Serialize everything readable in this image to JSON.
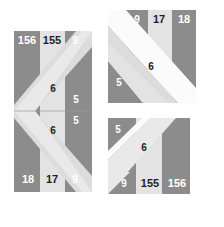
{
  "canvas": {
    "width": 224,
    "height": 227,
    "background": "#ffffff"
  },
  "palette": {
    "dark_gray": "#8c8c8c",
    "mid_gray": "#a8a8a8",
    "light_gray": "#e3e3e3",
    "pale_gray": "#d8d8d8",
    "white": "#ffffff",
    "label_light": "#ffffff",
    "label_dark": "#231f20",
    "hairline": "#9a9a9a"
  },
  "figures": [
    {
      "id": "shape-left",
      "name": "left-chevron-figure",
      "bounds": {
        "x": 14,
        "y": 31,
        "width": 78,
        "height": 161
      },
      "labels": [
        {
          "id": "l-156",
          "text": "156",
          "x": 27,
          "y": 41,
          "tone": "light",
          "size": "s11"
        },
        {
          "id": "l-155",
          "text": "155",
          "x": 52,
          "y": 41,
          "tone": "dark",
          "size": "s11"
        },
        {
          "id": "l-9t",
          "text": "9",
          "x": 75,
          "y": 41,
          "tone": "light",
          "size": "s10"
        },
        {
          "id": "l-6t",
          "text": "6",
          "x": 53,
          "y": 89,
          "tone": "dark",
          "size": "s10"
        },
        {
          "id": "l-5t",
          "text": "5",
          "x": 76,
          "y": 100,
          "tone": "light",
          "size": "s10"
        },
        {
          "id": "l-5b",
          "text": "5",
          "x": 76,
          "y": 121,
          "tone": "light",
          "size": "s10"
        },
        {
          "id": "l-6b",
          "text": "6",
          "x": 53,
          "y": 131,
          "tone": "dark",
          "size": "s10"
        },
        {
          "id": "l-18",
          "text": "18",
          "x": 28,
          "y": 180,
          "tone": "light",
          "size": "s11"
        },
        {
          "id": "l-17",
          "text": "17",
          "x": 52,
          "y": 180,
          "tone": "dark",
          "size": "s11"
        },
        {
          "id": "l-9b",
          "text": "9",
          "x": 75,
          "y": 180,
          "tone": "light",
          "size": "s10"
        }
      ]
    },
    {
      "id": "shape-topright",
      "name": "top-right-triangle-figure",
      "bounds": {
        "x": 108,
        "y": 10,
        "width": 88,
        "height": 93
      },
      "labels": [
        {
          "id": "tr-9",
          "text": "9",
          "x": 137,
          "y": 20,
          "tone": "light",
          "size": "s10"
        },
        {
          "id": "tr-17",
          "text": "17",
          "x": 159,
          "y": 20,
          "tone": "dark",
          "size": "s11"
        },
        {
          "id": "tr-18",
          "text": "18",
          "x": 184,
          "y": 20,
          "tone": "light",
          "size": "s11"
        },
        {
          "id": "tr-6",
          "text": "6",
          "x": 151,
          "y": 67,
          "tone": "dark",
          "size": "s10"
        },
        {
          "id": "tr-5",
          "text": "5",
          "x": 119,
          "y": 83,
          "tone": "light",
          "size": "s10"
        }
      ]
    },
    {
      "id": "shape-bottomright",
      "name": "bottom-right-triangle-figure",
      "bounds": {
        "x": 108,
        "y": 118,
        "width": 82,
        "height": 76
      },
      "labels": [
        {
          "id": "br-5",
          "text": "5",
          "x": 118,
          "y": 130,
          "tone": "light",
          "size": "s10"
        },
        {
          "id": "br-6",
          "text": "6",
          "x": 144,
          "y": 148,
          "tone": "dark",
          "size": "s10"
        },
        {
          "id": "br-9",
          "text": "9",
          "x": 124,
          "y": 184,
          "tone": "light",
          "size": "s10"
        },
        {
          "id": "br-155",
          "text": "155",
          "x": 150,
          "y": 184,
          "tone": "dark",
          "size": "s11"
        },
        {
          "id": "br-156",
          "text": "156",
          "x": 177,
          "y": 184,
          "tone": "light",
          "size": "s11"
        }
      ]
    }
  ]
}
